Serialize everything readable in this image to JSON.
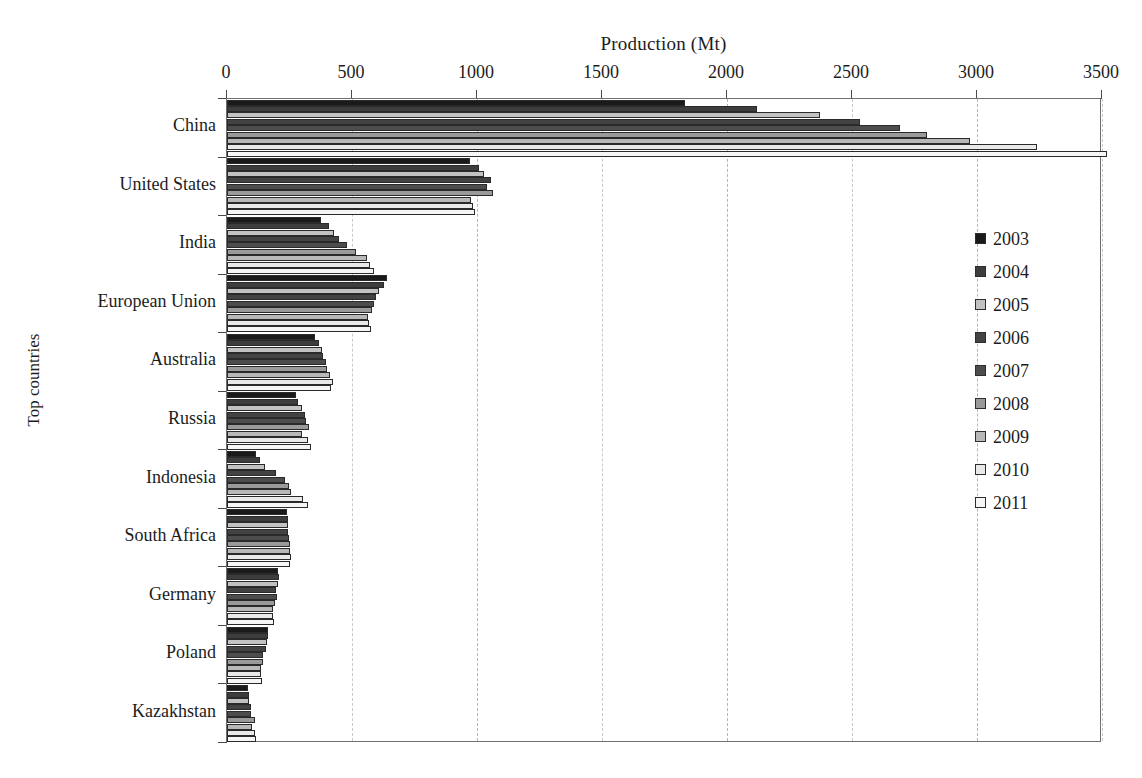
{
  "chart_data": {
    "type": "bar",
    "orientation": "horizontal",
    "title": "",
    "xlabel": "Production (Mt)",
    "ylabel": "Top countries",
    "xlim": [
      0,
      3500
    ],
    "xticks": [
      0,
      500,
      1000,
      1500,
      2000,
      2500,
      3000,
      3500
    ],
    "grid": true,
    "grid_axis": "x",
    "legend_position": "right",
    "categories": [
      "China",
      "United States",
      "India",
      "European Union",
      "Australia",
      "Russia",
      "Indonesia",
      "South Africa",
      "Germany",
      "Poland",
      "Kazakhstan"
    ],
    "series": [
      {
        "name": "2003",
        "color": "#1a1a1a",
        "values": [
          1830,
          972,
          375,
          638,
          351,
          276,
          115,
          238,
          205,
          163,
          85
        ]
      },
      {
        "name": "2004",
        "color": "#3d3d3d",
        "values": [
          2120,
          1008,
          408,
          628,
          366,
          282,
          132,
          243,
          208,
          162,
          87
        ]
      },
      {
        "name": "2005",
        "color": "#c2c2c2",
        "values": [
          2370,
          1026,
          428,
          608,
          378,
          298,
          152,
          245,
          202,
          159,
          88
        ]
      },
      {
        "name": "2006",
        "color": "#434343",
        "values": [
          2530,
          1054,
          447,
          595,
          385,
          310,
          195,
          245,
          197,
          157,
          96
        ]
      },
      {
        "name": "2007",
        "color": "#4d4d4d",
        "values": [
          2690,
          1040,
          478,
          588,
          394,
          314,
          231,
          247,
          201,
          145,
          97
        ]
      },
      {
        "name": "2008",
        "color": "#9a9a9a",
        "values": [
          2800,
          1063,
          515,
          580,
          399,
          326,
          246,
          250,
          192,
          144,
          111
        ]
      },
      {
        "name": "2009",
        "color": "#b8b8b8",
        "values": [
          2970,
          975,
          558,
          565,
          413,
          301,
          256,
          251,
          184,
          135,
          101
        ]
      },
      {
        "name": "2010",
        "color": "#e9e9e9",
        "values": [
          3240,
          983,
          570,
          566,
          424,
          322,
          305,
          255,
          182,
          134,
          111
        ]
      },
      {
        "name": "2011",
        "color": "#f6f6f6",
        "values": [
          3520,
          993,
          588,
          576,
          415,
          334,
          324,
          253,
          189,
          139,
          116
        ]
      }
    ]
  },
  "legend": {
    "entries": [
      {
        "label": "2003",
        "color": "#1a1a1a"
      },
      {
        "label": "2004",
        "color": "#3d3d3d"
      },
      {
        "label": "2005",
        "color": "#c2c2c2"
      },
      {
        "label": "2006",
        "color": "#434343"
      },
      {
        "label": "2007",
        "color": "#4d4d4d"
      },
      {
        "label": "2008",
        "color": "#9a9a9a"
      },
      {
        "label": "2009",
        "color": "#b8b8b8"
      },
      {
        "label": "2010",
        "color": "#e9e9e9"
      },
      {
        "label": "2011",
        "color": "#f6f6f6"
      }
    ]
  }
}
